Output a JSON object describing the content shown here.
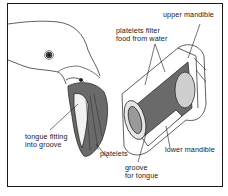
{
  "figure": {
    "labels": {
      "upper_mandible": "upper mandible",
      "platelets_filter_line1": "platelets filter",
      "platelets_filter_line2": "food from water",
      "tongue_line1": "tongue fitting",
      "tongue_line2": "into groove",
      "platelets": "platelets",
      "lower_mandible": "lower mandible",
      "groove_line1": "groove",
      "groove_line2": "for tongue"
    },
    "colors": {
      "ink": "#1a1a1a",
      "paper": "#ffffff",
      "shade": "#555555"
    }
  }
}
